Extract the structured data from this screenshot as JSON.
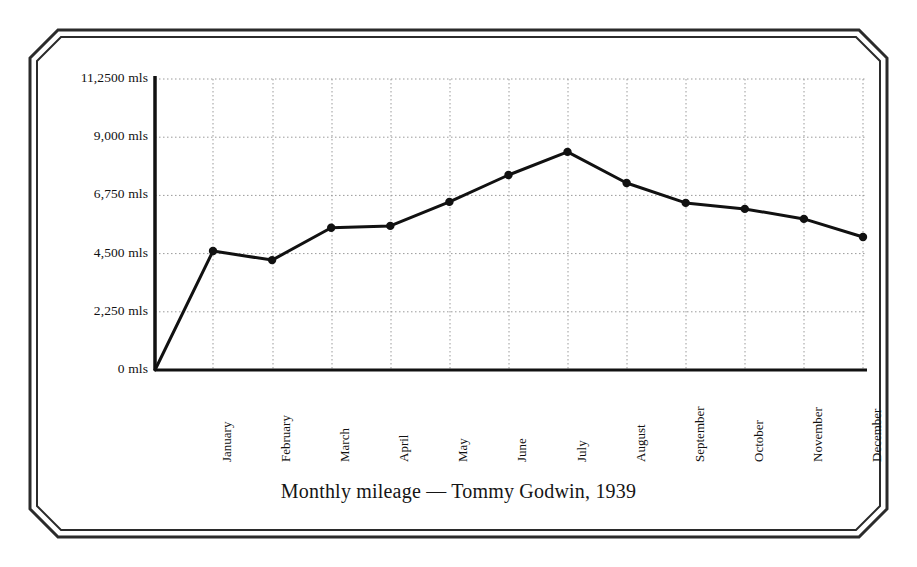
{
  "figure": {
    "frame_style": "double-line-octagon",
    "frame_color": "#2b2b2b",
    "background_color": "#ffffff"
  },
  "chart_data": {
    "type": "line",
    "title": "Monthly mileage — Tommy Godwin, 1939",
    "xlabel": "",
    "ylabel": "",
    "categories": [
      "January",
      "February",
      "March",
      "April",
      "May",
      "June",
      "July",
      "August",
      "September",
      "October",
      "November",
      "December"
    ],
    "values": [
      4600,
      4250,
      5500,
      5570,
      6500,
      7540,
      8430,
      7230,
      6460,
      6230,
      5840,
      5140
    ],
    "series": [
      {
        "name": "Monthly mileage",
        "values": [
          4600,
          4250,
          5500,
          5570,
          6500,
          7540,
          8430,
          7230,
          6460,
          6230,
          5840,
          5140
        ]
      }
    ],
    "ylim": [
      0,
      11250
    ],
    "ytick_values": [
      0,
      2250,
      4500,
      6750,
      9000,
      11250
    ],
    "ytick_labels": [
      "0 mls",
      "2,250 mls",
      "4,500 mls",
      "6,750 mls",
      "9,000 mls",
      "11,2500 mls"
    ],
    "unit": "mls",
    "grid": true,
    "grid_style": "dotted",
    "grid_color": "#9a9a9a",
    "legend": false,
    "legend_position": "none",
    "line_color": "#111111",
    "line_width": 3,
    "marker": "circle",
    "marker_color": "#111111",
    "axis_color": "#111111"
  }
}
